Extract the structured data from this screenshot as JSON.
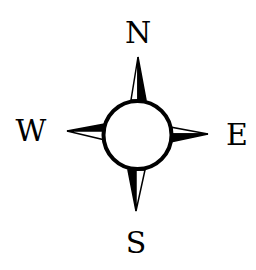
{
  "compass": {
    "labels": {
      "north": "N",
      "east": "E",
      "south": "S",
      "west": "W"
    },
    "colors": {
      "ink": "#000000",
      "background": "#ffffff"
    }
  }
}
